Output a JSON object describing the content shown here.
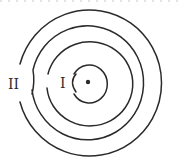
{
  "diagram": {
    "type": "concentric-rings",
    "center": {
      "x": 88,
      "y": 82
    },
    "labels": {
      "inner": "I",
      "outer": "II"
    },
    "rings": [
      {
        "name": "ring-1",
        "r": 18
      },
      {
        "name": "ring-2",
        "r": 43
      },
      {
        "name": "ring-3",
        "r": 57
      },
      {
        "name": "ring-4",
        "r": 72
      }
    ],
    "colors": {
      "stroke": "#2a2a2a",
      "background": "#ffffff"
    }
  }
}
